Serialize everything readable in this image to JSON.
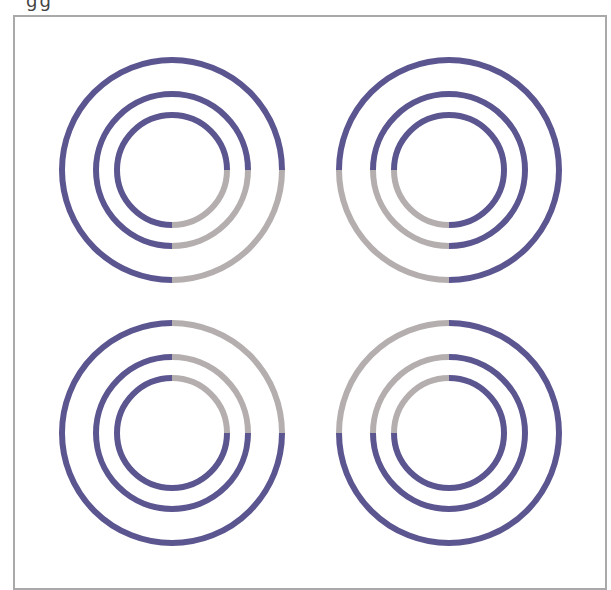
{
  "figure": {
    "top_fragment": "gg",
    "colors": {
      "active": "#5b5690",
      "inactive": "#b5aeae",
      "frame": "#a9a9a9"
    },
    "stroke_width": 6,
    "radii": [
      110,
      76,
      55
    ],
    "groups": [
      {
        "name": "top-left",
        "cx": 172,
        "cy": 170,
        "grey_quadrant": "bottom-right"
      },
      {
        "name": "top-right",
        "cx": 449,
        "cy": 170,
        "grey_quadrant": "bottom-left"
      },
      {
        "name": "bottom-left",
        "cx": 172,
        "cy": 433,
        "grey_quadrant": "top-right"
      },
      {
        "name": "bottom-right",
        "cx": 449,
        "cy": 433,
        "grey_quadrant": "top-left"
      }
    ]
  }
}
